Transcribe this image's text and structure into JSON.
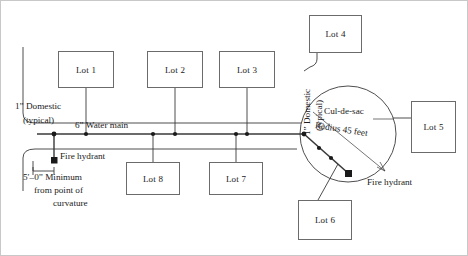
{
  "diagram": {
    "frame_color": "#c8c8c8",
    "line_color": "#3a3a3a",
    "box_border_color": "#6b6b6b",
    "lots": [
      {
        "id": "lot1",
        "label": "Lot 1",
        "x": 57,
        "y": 50,
        "w": 56,
        "h": 37
      },
      {
        "id": "lot2",
        "label": "Lot 2",
        "x": 146,
        "y": 50,
        "w": 56,
        "h": 37
      },
      {
        "id": "lot3",
        "label": "Lot 3",
        "x": 218,
        "y": 50,
        "w": 56,
        "h": 37
      },
      {
        "id": "lot4",
        "label": "Lot 4",
        "x": 308,
        "y": 14,
        "w": 53,
        "h": 38
      },
      {
        "id": "lot5",
        "label": "Lot 5",
        "x": 410,
        "y": 100,
        "w": 45,
        "h": 52
      },
      {
        "id": "lot6",
        "label": "Lot 6",
        "x": 297,
        "y": 199,
        "w": 54,
        "h": 40
      },
      {
        "id": "lot7",
        "label": "Lot 7",
        "x": 208,
        "y": 161,
        "w": 54,
        "h": 33
      },
      {
        "id": "lot8",
        "label": "Lot 8",
        "x": 125,
        "y": 161,
        "w": 54,
        "h": 33
      }
    ],
    "annotations": {
      "domestic_left_line1": "1” Domestic",
      "domestic_left_line2": "(typical)",
      "water_main": "6” Water main",
      "fire_hydrant_left": "Fire hydrant",
      "fire_hydrant_right": "Fire hydrant",
      "minimum_line1": "5′–0” Minimum",
      "minimum_line2": "from point of",
      "minimum_line3": "curvature",
      "domestic_rot_line1": "1” Domestic",
      "domestic_rot_line2": "(typical)",
      "culdesac": "Cul-de-sac",
      "radius": "Radius 45 feet"
    }
  }
}
